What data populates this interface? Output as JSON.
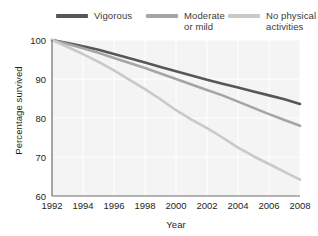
{
  "legend": {
    "position": "top",
    "items": [
      {
        "label": "Vigorous",
        "color": "#575757"
      },
      {
        "label": "Moderate\nor mild",
        "color": "#a5a5a5"
      },
      {
        "label": "No physical\nactivities",
        "color": "#c9c9c9"
      }
    ]
  },
  "axes": {
    "xlabel": "Year",
    "ylabel": "Percentage survived",
    "xticks": [
      "1992",
      "1994",
      "1996",
      "1998",
      "2000",
      "2002",
      "2004",
      "2006",
      "2008"
    ],
    "yticks": [
      "60",
      "70",
      "80",
      "90",
      "100"
    ]
  },
  "chart_data": {
    "type": "line",
    "title": "",
    "xlabel": "Year",
    "ylabel": "Percentage survived",
    "xlim": [
      1992,
      2008
    ],
    "ylim": [
      60,
      100
    ],
    "xticks": [
      1992,
      1994,
      1996,
      1998,
      2000,
      2002,
      2004,
      2006,
      2008
    ],
    "yticks": [
      60,
      70,
      80,
      90,
      100
    ],
    "grid": true,
    "legend_position": "top",
    "x": [
      1992,
      1993,
      1994,
      1995,
      1996,
      1997,
      1998,
      1999,
      2000,
      2001,
      2002,
      2003,
      2004,
      2005,
      2006,
      2007,
      2008
    ],
    "series": [
      {
        "name": "Vigorous",
        "color": "#575757",
        "values": [
          100,
          99.2,
          98.4,
          97.5,
          96.4,
          95.3,
          94.2,
          93.1,
          92.0,
          90.9,
          89.8,
          88.8,
          87.8,
          86.8,
          85.8,
          84.8,
          83.6
        ]
      },
      {
        "name": "Moderate or mild",
        "color": "#a5a5a5",
        "values": [
          100,
          99.0,
          97.9,
          96.7,
          95.4,
          94.1,
          92.8,
          91.4,
          90.0,
          88.6,
          87.2,
          85.8,
          84.2,
          82.6,
          81.0,
          79.5,
          78.0
        ]
      },
      {
        "name": "No physical activities",
        "color": "#c9c9c9",
        "values": [
          100,
          98.2,
          96.4,
          94.4,
          92.2,
          89.8,
          87.4,
          84.8,
          82.0,
          79.6,
          77.4,
          75.0,
          72.4,
          70.2,
          68.2,
          66.2,
          64.2
        ]
      }
    ]
  }
}
